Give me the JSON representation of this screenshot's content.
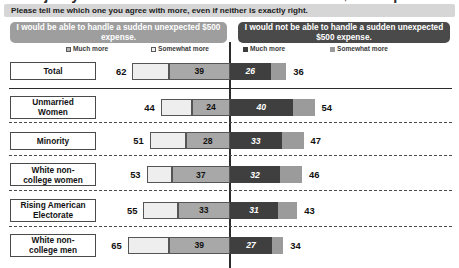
{
  "title_cut_off": "Majority of unmarried women can't deal with a $500 expense",
  "subtitle": "Please tell me which one you agree with more, even if neither is exactly right.",
  "statements": {
    "left": "I would be able to handle a sudden unexpected $500 expense.",
    "right": "I would not be able to handle a sudden unexpected $500 expense."
  },
  "legend": {
    "left_much": "Much more",
    "left_somewhat": "Somewhat more",
    "right_much": "Much more",
    "right_somewhat": "Somewhat more"
  },
  "colors": {
    "left_banner": "#9e9e9e",
    "right_banner": "#4a4a4a",
    "left_somewhat": "#eeeeee",
    "left_much": "#a8a8a8",
    "right_much": "#3f3f3f",
    "right_somewhat": "#9b9b9b",
    "subtitle_banner": "#d6d6d6",
    "center_line": "#2c2c2c"
  },
  "chart_data": {
    "type": "bar",
    "orientation": "horizontal",
    "subtype": "diverging-stacked",
    "title": "Majority of unmarried women can't deal with a $500 expense",
    "subtitle": "Please tell me which one you agree with more, even if neither is exactly right.",
    "xlabel": "",
    "ylabel": "",
    "grid": false,
    "legend_position": "top",
    "center_at_zero": true,
    "categories": [
      "Total",
      "Unmarried Women",
      "Minority",
      "White non-college women",
      "Rising American Electorate",
      "White non-college men"
    ],
    "series": [
      {
        "name": "I would be able to handle a sudden unexpected $500 expense. — Somewhat more",
        "side": "left",
        "values": [
          23,
          20,
          23,
          16,
          22,
          26
        ]
      },
      {
        "name": "I would be able to handle a sudden unexpected $500 expense. — Much more",
        "side": "left",
        "values": [
          39,
          24,
          28,
          37,
          33,
          39
        ]
      },
      {
        "name": "I would not be able to handle a sudden unexpected $500 expense. — Much more",
        "side": "right",
        "values": [
          26,
          40,
          33,
          32,
          31,
          27
        ]
      },
      {
        "name": "I would not be able to handle a sudden unexpected $500 expense. — Somewhat more",
        "side": "right",
        "values": [
          10,
          14,
          14,
          14,
          12,
          7
        ]
      }
    ],
    "rows": [
      {
        "label": "Total",
        "left_total": 62,
        "left_much": 39,
        "right_much": 26,
        "right_total": 36
      },
      {
        "label": "Unmarried Women",
        "left_total": 44,
        "left_much": 24,
        "right_much": 40,
        "right_total": 54
      },
      {
        "label": "Minority",
        "left_total": 51,
        "left_much": 28,
        "right_much": 33,
        "right_total": 47
      },
      {
        "label": "White non-college women",
        "left_total": 53,
        "left_much": 37,
        "right_much": 32,
        "right_total": 46
      },
      {
        "label": "Rising American Electorate",
        "left_total": 55,
        "left_much": 33,
        "right_much": 31,
        "right_total": 43
      },
      {
        "label": "White non-college men",
        "left_total": 65,
        "left_much": 39,
        "right_much": 27,
        "right_total": 34
      }
    ]
  },
  "rows_display": [
    {
      "label_line1": "Total",
      "label_line2": "",
      "left_total": "62",
      "left_much": "39",
      "right_much": "26",
      "right_total": "36"
    },
    {
      "label_line1": "Unmarried",
      "label_line2": "Women",
      "left_total": "44",
      "left_much": "24",
      "right_much": "40",
      "right_total": "54"
    },
    {
      "label_line1": "Minority",
      "label_line2": "",
      "left_total": "51",
      "left_much": "28",
      "right_much": "33",
      "right_total": "47"
    },
    {
      "label_line1": "White non-",
      "label_line2": "college women",
      "left_total": "53",
      "left_much": "37",
      "right_much": "32",
      "right_total": "46"
    },
    {
      "label_line1": "Rising American",
      "label_line2": "Electorate",
      "left_total": "55",
      "left_much": "33",
      "right_much": "31",
      "right_total": "43"
    },
    {
      "label_line1": "White non-",
      "label_line2": "college men",
      "left_total": "65",
      "left_much": "39",
      "right_much": "27",
      "right_total": "34"
    }
  ]
}
